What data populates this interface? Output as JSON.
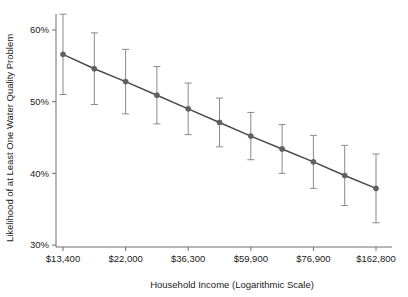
{
  "chart_data": {
    "type": "line",
    "title": "",
    "subtitle": "",
    "xlabel": "Household Income  (Logarithmic Scale)",
    "ylabel": "Likelihood of at Least One Water Quality Problem",
    "x_tick_labels": [
      "$13,400",
      "$22,000",
      "$36,300",
      "$59,900",
      "$76,900",
      "$162,800"
    ],
    "x_tick_values": [
      13400,
      22000,
      36300,
      59900,
      76900,
      162800
    ],
    "y_tick_labels": [
      "30%",
      "40%",
      "50%",
      "60%"
    ],
    "y_tick_values": [
      30,
      40,
      50,
      60
    ],
    "ylim": [
      27.5,
      63.5
    ],
    "x_scale": "log",
    "grid": false,
    "legend": false,
    "legend_position": "none",
    "series": [
      {
        "name": "Likelihood of at Least One Water Quality Problem",
        "marker": "circle",
        "color": "#555555",
        "x_positions": [
          0.0,
          0.1,
          0.2,
          0.3,
          0.4,
          0.5,
          0.6,
          0.7,
          0.8,
          0.9,
          1.0
        ],
        "values": [
          56.6,
          54.6,
          52.8,
          50.9,
          49.0,
          47.1,
          45.2,
          43.4,
          41.6,
          39.7,
          37.9
        ],
        "error_low": [
          51.0,
          49.6,
          48.3,
          46.9,
          45.4,
          43.7,
          41.9,
          40.0,
          37.9,
          35.5,
          33.1
        ],
        "error_high": [
          62.2,
          59.6,
          57.3,
          54.9,
          52.6,
          50.5,
          48.5,
          46.8,
          45.3,
          43.9,
          42.7
        ]
      }
    ],
    "annotations": []
  },
  "colors": {
    "axis": "#6e6e6e",
    "line": "#4a4a4a",
    "marker": "#606060",
    "errorbar": "#8a8a8a",
    "text": "#1a1a1a",
    "background": "#ffffff"
  }
}
